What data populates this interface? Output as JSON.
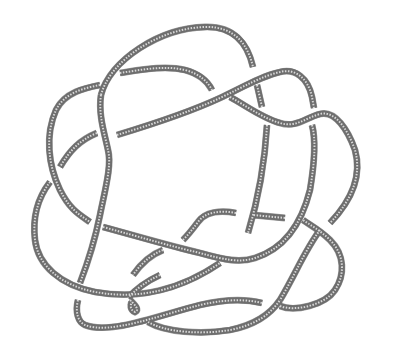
{
  "diagram": {
    "type": "knot-diagram",
    "style": "rope",
    "rope_color": "#6e6e6e",
    "highlight_color": "#d8d8d8",
    "background": "#ffffff",
    "strands": [
      "M 101 95 C 110 60, 160 28, 205 27 C 235 26, 248 45, 253 67",
      "M 257 85 L 262 107",
      "M 101 95 C 98 115, 105 135, 108 150 C 112 165, 105 190, 100 215 C 95 240, 85 270, 80 283",
      "M 78 300 C 75 312, 78 322, 85 325 C 110 335, 160 315, 200 305 C 230 298, 250 300, 262 303",
      "M 280 306 C 295 312, 325 305, 335 290 C 345 275, 345 255, 330 240 C 320 230, 310 225, 303 220",
      "M 285 218 L 253 215",
      "M 236 213 C 220 210, 205 212, 198 222 C 192 230, 188 235, 183 240",
      "M 120 73 C 140 70, 165 65, 185 70 C 200 74, 208 82, 212 90",
      "M 100 85 C 85 88, 65 92, 56 110 C 45 135, 48 165, 60 190 C 70 210, 80 215, 90 222",
      "M 97 133 C 80 140, 70 150, 60 167",
      "M 50 182 C 40 195, 32 215, 35 240 C 38 265, 60 285, 95 292 C 140 300, 180 290, 220 263",
      "M 103 227 C 140 237, 170 246, 200 253 C 225 260, 240 263, 255 258 C 280 250, 300 230, 310 190 C 315 160, 316 140, 312 125",
      "M 117 135 C 150 125, 190 112, 220 98 C 245 86, 262 76, 280 72 C 295 68, 308 78, 312 97 L 314 108",
      "M 230 97 C 245 105, 262 118, 280 123 C 296 128, 305 118, 320 114 C 335 110, 348 130, 355 150 C 362 175, 352 200, 330 223",
      "M 267 125 C 265 160, 258 200, 248 233",
      "M 320 230 C 305 250, 295 275, 280 300",
      "M 160 275 C 145 282, 135 290, 128 298",
      "M 163 250 C 150 255, 140 265, 133 275",
      "M 130 300 C 135 305, 140 310, 135 312 C 130 310, 130 305, 132 302",
      "M 148 322 C 165 332, 200 335, 230 330 C 255 325, 270 315, 280 300"
    ]
  }
}
